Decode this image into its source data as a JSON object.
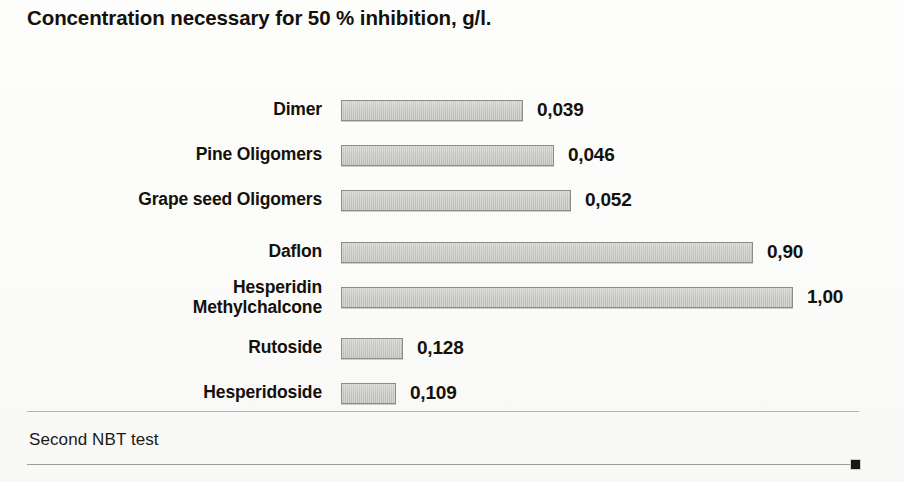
{
  "chart_data": {
    "type": "bar",
    "orientation": "horizontal",
    "title": "Concentration necessary for 50 % inhibition, g/l.",
    "xlabel": "",
    "ylabel": "",
    "decimal_separator": ",",
    "units": "g/l",
    "grid": false,
    "legend": null,
    "categories": [
      "Dimer",
      "Pine Oligomers",
      "Grape seed Oligomers",
      "Daflon",
      "Hesperidin\nMethylchalcone",
      "Rutoside",
      "Hesperidoside"
    ],
    "values": [
      0.039,
      0.046,
      0.052,
      0.9,
      1.0,
      0.128,
      0.109
    ],
    "value_labels": [
      "0,039",
      "0,046",
      "0,052",
      "0,90",
      "1,00",
      "0,128",
      "0,109"
    ],
    "bar_pixel_widths": [
      182,
      213,
      230,
      412,
      452,
      62,
      55
    ],
    "bars": [
      {
        "label": "Dimer",
        "value": 0.039,
        "value_label": "0,039",
        "bar_width": 182,
        "two_line": false
      },
      {
        "label": "Pine Oligomers",
        "value": 0.046,
        "value_label": "0,046",
        "bar_width": 213,
        "two_line": false
      },
      {
        "label": "Grape seed Oligomers",
        "value": 0.052,
        "value_label": "0,052",
        "bar_width": 230,
        "two_line": false
      },
      {
        "label": "Daflon",
        "value": 0.9,
        "value_label": "0,90",
        "bar_width": 412,
        "two_line": false
      },
      {
        "label": "Hesperidin\nMethylchalcone",
        "value": 1.0,
        "value_label": "1,00",
        "bar_width": 452,
        "two_line": true
      },
      {
        "label": "Rutoside",
        "value": 0.128,
        "value_label": "0,128",
        "bar_width": 62,
        "two_line": false
      },
      {
        "label": "Hesperidoside",
        "value": 0.109,
        "value_label": "0,109",
        "bar_width": 55,
        "two_line": false
      }
    ],
    "colors": {
      "bar_fill": "#c7c7c4",
      "bar_border": "#8b8b87",
      "text": "#14110d",
      "background": "#fbfbf9",
      "rule": "#b4b4b0",
      "marker": "#1a1713"
    }
  },
  "footer": {
    "note": "Second NBT test"
  }
}
